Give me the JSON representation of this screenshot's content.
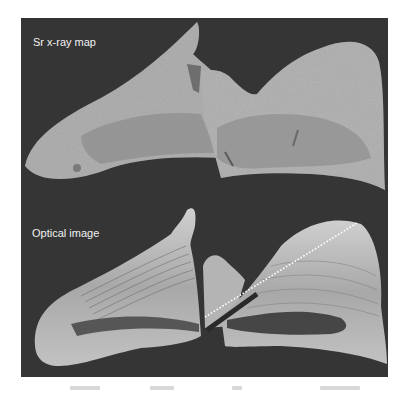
{
  "figure": {
    "background_color": "#353535",
    "panels": [
      {
        "id": "top",
        "label": "Sr x-ray map",
        "description": "grayscale strontium x-ray map of otolith section",
        "fill_light": "#b4b4b4",
        "fill_dark": "#8e8e8e"
      },
      {
        "id": "bottom",
        "label": "Optical image",
        "description": "optical micrograph of otolith section with growth bands",
        "fill_light": "#c8c8c8",
        "fill_dark": "#4a4a4a",
        "transect_line": {
          "style": "dotted",
          "color": "#ffffff",
          "start": [
            205,
            317
          ],
          "end": [
            357,
            223
          ]
        }
      }
    ]
  }
}
